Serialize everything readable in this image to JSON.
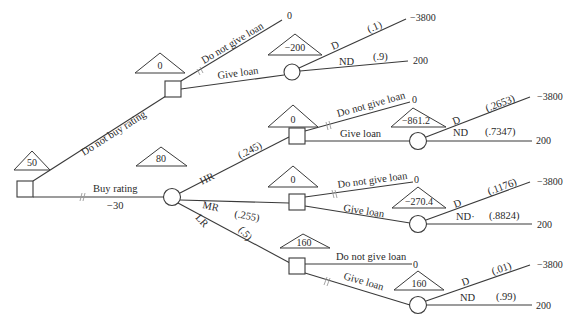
{
  "diagram": {
    "type": "decision-tree",
    "root": {
      "node_type": "decision",
      "expected_value": "50",
      "branches": [
        {
          "label": "Do not buy rating",
          "blocked": false,
          "node": {
            "node_type": "decision",
            "expected_value": "0",
            "branches": [
              {
                "label": "Do not give loan",
                "blocked": true,
                "payoff": "0"
              },
              {
                "label": "Give loan",
                "node": {
                  "node_type": "chance",
                  "expected_value": "−200",
                  "branches": [
                    {
                      "label": "D",
                      "prob": "(.1)",
                      "payoff": "−3800"
                    },
                    {
                      "label": "ND",
                      "prob": "(.9)",
                      "payoff": "200"
                    }
                  ]
                }
              }
            ]
          }
        },
        {
          "label": "Buy rating",
          "cost": "−30",
          "blocked": true,
          "node": {
            "node_type": "chance",
            "expected_value": "80",
            "branches": [
              {
                "label": "HR",
                "prob": "(.245)",
                "node": {
                  "node_type": "decision",
                  "expected_value": "0",
                  "branches": [
                    {
                      "label": "Do not give loan",
                      "payoff": "0"
                    },
                    {
                      "label": "Give loan",
                      "blocked": true,
                      "node": {
                        "node_type": "chance",
                        "expected_value": "−861.2",
                        "branches": [
                          {
                            "label": "D",
                            "prob": "(.2653)",
                            "payoff": "−3800"
                          },
                          {
                            "label": "ND",
                            "prob": "(.7347)",
                            "payoff": "200"
                          }
                        ]
                      }
                    }
                  ]
                }
              },
              {
                "label": "MR",
                "prob": "(.255)",
                "node": {
                  "node_type": "decision",
                  "expected_value": "0",
                  "branches": [
                    {
                      "label": "Do not give loan",
                      "payoff": "0"
                    },
                    {
                      "label": "Give loan",
                      "blocked": true,
                      "node": {
                        "node_type": "chance",
                        "expected_value": "−270.4",
                        "branches": [
                          {
                            "label": "D",
                            "prob": "(.1176)",
                            "payoff": "−3800"
                          },
                          {
                            "label": "ND",
                            "prob": "(.8824)",
                            "payoff": "200"
                          }
                        ]
                      }
                    }
                  ]
                }
              },
              {
                "label": "LR",
                "prob": "(.5)",
                "node": {
                  "node_type": "decision",
                  "expected_value": "160",
                  "branches": [
                    {
                      "label": "Do not give loan",
                      "blocked": true,
                      "payoff": "0"
                    },
                    {
                      "label": "Give loan",
                      "node": {
                        "node_type": "chance",
                        "expected_value": "160",
                        "branches": [
                          {
                            "label": "D",
                            "prob": "(.01)",
                            "payoff": "−3800"
                          },
                          {
                            "label": "ND",
                            "prob": "(.99)",
                            "payoff": "200"
                          }
                        ]
                      }
                    }
                  ]
                }
              }
            ]
          }
        }
      ]
    }
  },
  "labels": {
    "root_ev": "50",
    "no_rating": "Do not buy rating",
    "buy_rating": "Buy rating",
    "buy_cost": "−30",
    "nr_ev": "0",
    "nr_no_loan": "Do not give loan",
    "nr_no_loan_payoff": "0",
    "nr_give_loan": "Give loan",
    "nr_chance_ev": "−200",
    "nr_d": "D",
    "nr_d_prob": "(.1)",
    "nr_d_payoff": "−3800",
    "nr_nd": "ND",
    "nr_nd_prob": "(.9)",
    "nr_nd_payoff": "200",
    "rating_ev": "80",
    "hr": "HR",
    "hr_prob": "(.245)",
    "mr": "MR",
    "mr_prob": "(.255)",
    "lr": "LR",
    "lr_prob": "(.5)",
    "hr_ev": "0",
    "hr_no_loan": "Do not give loan",
    "hr_no_loan_payoff": "0",
    "hr_give_loan": "Give loan",
    "hr_chance_ev": "−861.2",
    "hr_d": "D",
    "hr_d_prob": "(.2653)",
    "hr_d_payoff": "−3800",
    "hr_nd": "ND",
    "hr_nd_prob": "(.7347)",
    "hr_nd_payoff": "200",
    "mr_ev": "0",
    "mr_no_loan": "Do not give loan",
    "mr_no_loan_payoff": "0",
    "mr_give_loan": "Give loan",
    "mr_chance_ev": "−270.4",
    "mr_d": "D",
    "mr_d_prob": "(.1176)",
    "mr_d_payoff": "−3800",
    "mr_nd": "ND·",
    "mr_nd_prob": "(.8824)",
    "mr_nd_payoff": "200",
    "lr_ev": "160",
    "lr_no_loan": "Do not give loan",
    "lr_no_loan_payoff": "0",
    "lr_give_loan": "Give loan",
    "lr_chance_ev": "160",
    "lr_d": "D",
    "lr_d_prob": "(.01)",
    "lr_d_payoff": "−3800",
    "lr_nd": "ND",
    "lr_nd_prob": "(.99)",
    "lr_nd_payoff": "200"
  }
}
